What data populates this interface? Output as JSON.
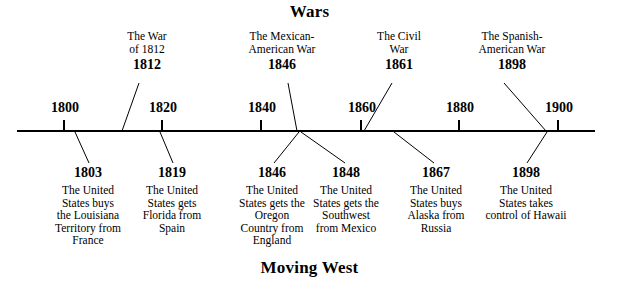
{
  "figure": {
    "top_title": "Wars",
    "bottom_title": "Moving West"
  },
  "axis": {
    "ticks": [
      {
        "label": "1800",
        "x": 63
      },
      {
        "label": "1820",
        "x": 161
      },
      {
        "label": "1840",
        "x": 260
      },
      {
        "label": "1860",
        "x": 360
      },
      {
        "label": "1880",
        "x": 458
      },
      {
        "label": "1900",
        "x": 557
      }
    ],
    "line_start_x": 17,
    "line_end_x": 595,
    "line_y": 131
  },
  "wars": [
    {
      "name": "The War\nof 1812",
      "year": "1812",
      "label_x": 147,
      "label_top": 30,
      "line": {
        "x1": 139,
        "y1": 83,
        "x2": 122,
        "y2": 131
      }
    },
    {
      "name": "The Mexican-\nAmerican War",
      "year": "1846",
      "label_x": 282,
      "label_top": 30,
      "line": {
        "x1": 288,
        "y1": 83,
        "x2": 297,
        "y2": 131
      }
    },
    {
      "name": "The Civil\nWar",
      "year": "1861",
      "label_x": 399,
      "label_top": 30,
      "line": {
        "x1": 392,
        "y1": 83,
        "x2": 364,
        "y2": 131
      }
    },
    {
      "name": "The Spanish-\nAmerican War",
      "year": "1898",
      "label_x": 512,
      "label_top": 30,
      "line": {
        "x1": 504,
        "y1": 83,
        "x2": 546,
        "y2": 131
      }
    }
  ],
  "events": [
    {
      "year": "1803",
      "description": "The United\nStates buys\nthe Louisiana\nTerritory from\nFrance",
      "label_x": 88,
      "label_top": 165,
      "line": {
        "x1": 75,
        "y1": 132,
        "x2": 89,
        "y2": 163
      }
    },
    {
      "year": "1819",
      "description": "The United\nStates gets\nFlorida from\nSpain",
      "label_x": 172,
      "label_top": 165,
      "line": {
        "x1": 160,
        "y1": 132,
        "x2": 173,
        "y2": 163
      }
    },
    {
      "year": "1846",
      "description": "The United\nStates gets the\nOregon\nCountry from\nEngland",
      "label_x": 272,
      "label_top": 165,
      "line": {
        "x1": 299,
        "y1": 132,
        "x2": 274,
        "y2": 163
      }
    },
    {
      "year": "1848",
      "description": "The United\nStates gets the\nSouthwest\nfrom Mexico",
      "label_x": 346,
      "label_top": 165,
      "line": {
        "x1": 301,
        "y1": 132,
        "x2": 345,
        "y2": 163
      }
    },
    {
      "year": "1867",
      "description": "The United\nStates buys\nAlaska from\nRussia",
      "label_x": 436,
      "label_top": 165,
      "line": {
        "x1": 394,
        "y1": 132,
        "x2": 434,
        "y2": 163
      }
    },
    {
      "year": "1898",
      "description": "The United\nStates takes\ncontrol of Hawaii",
      "label_x": 526,
      "label_top": 165,
      "line": {
        "x1": 547,
        "y1": 132,
        "x2": 527,
        "y2": 163
      }
    }
  ],
  "colors": {
    "ink": "#000000",
    "background": "#ffffff"
  }
}
